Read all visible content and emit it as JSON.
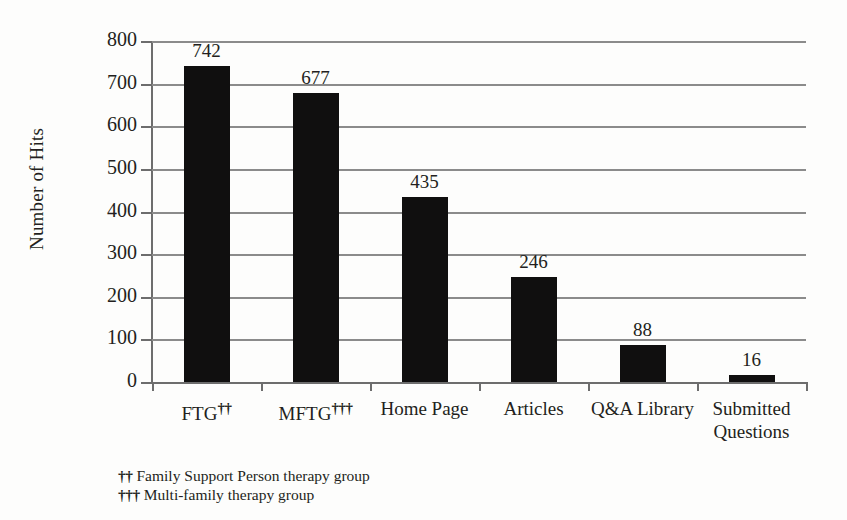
{
  "chart_data": {
    "type": "bar",
    "title": "",
    "xlabel": "",
    "ylabel": "Number of Hits",
    "ylim": [
      0,
      800
    ],
    "ytick_step": 100,
    "grid": true,
    "legend": "none",
    "orientation": "vertical",
    "bar_color": "#100f0f",
    "grid_color": "#8b8b8b",
    "categories": [
      "FTG",
      "MFTG",
      "Home Page",
      "Articles",
      "Q&A Library",
      "Submitted Questions"
    ],
    "category_markers": [
      "††",
      "†††",
      "",
      "",
      "",
      ""
    ],
    "values": [
      742,
      677,
      435,
      246,
      88,
      16
    ],
    "ytick_labels": [
      "800",
      "700",
      "600",
      "500",
      "400",
      "300",
      "200",
      "100",
      "0"
    ],
    "ytick_values": [
      800,
      700,
      600,
      500,
      400,
      300,
      200,
      100,
      0
    ],
    "bar_labels": [
      "742",
      "677",
      "435",
      "246",
      "88",
      "16"
    ]
  },
  "axis": {
    "y_title": "Number of Hits"
  },
  "categories_display": [
    {
      "line1": "FTG",
      "line2": "",
      "marker": "††"
    },
    {
      "line1": "MFTG",
      "line2": "",
      "marker": "†††"
    },
    {
      "line1": "Home  Page",
      "line2": "",
      "marker": ""
    },
    {
      "line1": "Articles",
      "line2": "",
      "marker": ""
    },
    {
      "line1": "Q&A Library",
      "line2": "",
      "marker": ""
    },
    {
      "line1": "Submitted",
      "line2": "Questions",
      "marker": ""
    }
  ],
  "footnotes": [
    {
      "mark": "††",
      "text": "Family Support Person therapy group"
    },
    {
      "mark": "†††",
      "text": "Multi-family therapy group"
    }
  ]
}
